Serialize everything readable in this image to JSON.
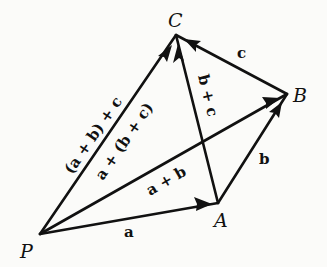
{
  "diagram": {
    "points": {
      "P": {
        "label": "P",
        "x": 40,
        "y": 234
      },
      "A": {
        "label": "A",
        "x": 218,
        "y": 203
      },
      "B": {
        "label": "B",
        "x": 287,
        "y": 94
      },
      "C": {
        "label": "C",
        "x": 176,
        "y": 35
      }
    },
    "vectors": [
      {
        "id": "a",
        "from": "P",
        "to": "A",
        "label": "a"
      },
      {
        "id": "b",
        "from": "A",
        "to": "B",
        "label": "b"
      },
      {
        "id": "c",
        "from": "B",
        "to": "C",
        "label": "c"
      },
      {
        "id": "a_plus_b",
        "from": "P",
        "to": "B",
        "label": "a + b"
      },
      {
        "id": "b_plus_c",
        "from": "A",
        "to": "C",
        "label": "b + c"
      },
      {
        "id": "sum_left",
        "from": "P",
        "to": "C",
        "label": "(a + b) + c"
      },
      {
        "id": "sum_right",
        "from": "P",
        "to": "C",
        "label": "a + (b + c)"
      }
    ],
    "colors": {
      "ink": "#111111",
      "paper": "#fbfbf9"
    }
  }
}
